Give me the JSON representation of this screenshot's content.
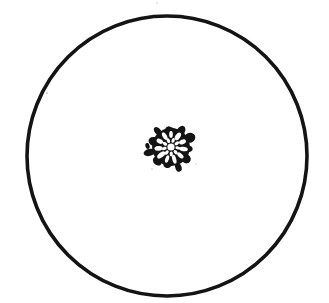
{
  "figure": {
    "title": "Circular field of view containing a single centred radial microfossil",
    "caption": "",
    "background_color": "#ffffff",
    "ink_color": "#111111",
    "canvas": {
      "width": 329,
      "height": 303
    }
  },
  "field_of_view": {
    "name": "field-of-view circle",
    "shape": "circle",
    "center_x": 167,
    "center_y": 156,
    "radius": 140,
    "stroke_color": "#141414",
    "stroke_width": 3.6,
    "fill": "none",
    "label": ""
  },
  "specimen": {
    "name": "radial rosette microfossil",
    "description": "Dark opaque test with a ring of radiating petal-shaped chambers around a small central lumen, bordered by an irregular spiky outer margin",
    "center_x": 171,
    "center_y": 147,
    "outer_radius": 22,
    "fill_color": "#141414",
    "chamber_fill": "#ffffff",
    "chamber_count": 11,
    "inner_chamber_count": 9,
    "central_lumen_radius": 3.6,
    "label": ""
  },
  "marks": [
    {
      "name": "detached-margin-fleck-left",
      "x": 147.5,
      "y": 146.0,
      "rx": 2.1,
      "ry": 3.0,
      "rotation": -15
    },
    {
      "name": "faint-speck-upper-left",
      "x": 47,
      "y": 93,
      "r": 0.8,
      "opacity": 0.35
    },
    {
      "name": "faint-speck-lower-left",
      "x": 152,
      "y": 169,
      "r": 0.7,
      "opacity": 0.3
    },
    {
      "name": "faint-speck-lower-right",
      "x": 196,
      "y": 164,
      "r": 0.7,
      "opacity": 0.28
    },
    {
      "name": "faint-speck-top",
      "x": 157,
      "y": 3,
      "r": 0.7,
      "opacity": 0.3
    }
  ],
  "chamber_ring": {
    "angles_deg": [
      -90,
      -57,
      -24,
      9,
      42,
      75,
      108,
      141,
      174,
      207,
      240
    ],
    "ring_radius": 12.6,
    "chamber_length": 8.4,
    "chamber_width": 4.3
  },
  "lobe_ring": {
    "angles_deg": [
      -90,
      -58,
      -26,
      6,
      38,
      70,
      102,
      134,
      166,
      198,
      230,
      262
    ],
    "lobe_radius": 19.5,
    "lobe_size": 5.0
  }
}
